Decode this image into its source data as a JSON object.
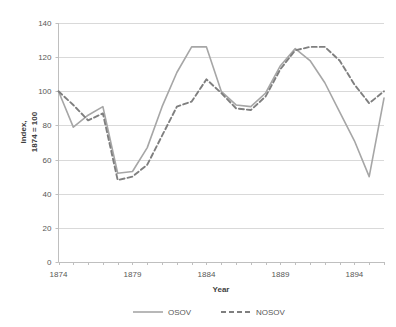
{
  "chart_data": {
    "type": "line",
    "title": "",
    "subtitle": "",
    "xlabel": "Year",
    "ylabel": "Index,\n1874 = 100",
    "ylabel_line1": "Index,",
    "ylabel_line2": "1874 = 100",
    "xlim": [
      1874,
      1896
    ],
    "ylim": [
      0,
      140
    ],
    "ytick_step": 20,
    "yticks": [
      0,
      20,
      40,
      60,
      80,
      100,
      120,
      140
    ],
    "ytick_labels": [
      "0",
      "20",
      "40",
      "60",
      "80",
      "100",
      "120",
      "140"
    ],
    "xticks": [
      1874,
      1879,
      1884,
      1889,
      1894
    ],
    "xtick_labels": [
      "1874",
      "1879",
      "1884",
      "1889",
      "1894"
    ],
    "x_minor_ticks_every": 1,
    "grid": "horizontal",
    "legend_position": "bottom",
    "x": [
      1874,
      1875,
      1876,
      1877,
      1878,
      1879,
      1880,
      1881,
      1882,
      1883,
      1884,
      1885,
      1886,
      1887,
      1888,
      1889,
      1890,
      1891,
      1892,
      1893,
      1894,
      1895,
      1896
    ],
    "series": [
      {
        "name": "OSOV",
        "style": "solid",
        "color": "#a6a6a6",
        "values": [
          100,
          79,
          86,
          91,
          52,
          53,
          67,
          91,
          111,
          126,
          126,
          100,
          92,
          91,
          99,
          115,
          125,
          118,
          105,
          88,
          71,
          50,
          96
        ]
      },
      {
        "name": "NOSOV",
        "style": "dashed",
        "color": "#7f7f7f",
        "values": [
          100,
          92,
          83,
          87,
          48,
          50,
          57,
          74,
          91,
          94,
          107,
          99,
          90,
          89,
          97,
          113,
          124,
          126,
          126,
          118,
          104,
          93,
          100
        ]
      }
    ]
  },
  "legend": {
    "items": [
      {
        "label": "OSOV",
        "style": "solid"
      },
      {
        "label": "NOSOV",
        "style": "dashed"
      }
    ]
  },
  "axes": {
    "x_title": "Year",
    "y_title_line1": "Index,",
    "y_title_line2": "1874 = 100"
  }
}
